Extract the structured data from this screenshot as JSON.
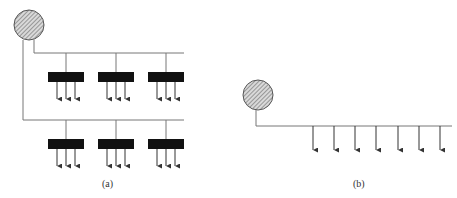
{
  "figure": {
    "panels": [
      {
        "id": "a",
        "caption": "(a)",
        "source": {
          "shape": "circle",
          "fill": "hatched",
          "cx": 29,
          "cy": 25,
          "r": 15
        },
        "branches": [
          {
            "y": 53,
            "units": [
              {
                "x": 50
              },
              {
                "x": 100
              },
              {
                "x": 150
              }
            ]
          },
          {
            "y": 120,
            "units": [
              {
                "x": 50
              },
              {
                "x": 100
              },
              {
                "x": 150
              }
            ]
          }
        ],
        "arrows_per_unit": 3
      },
      {
        "id": "b",
        "caption": "(b)",
        "source": {
          "shape": "circle",
          "fill": "hatched",
          "cx": 258,
          "cy": 95,
          "r": 15
        },
        "line_y": 126,
        "arrow_count": 7
      }
    ],
    "colors": {
      "line": "#777777",
      "unit": "#111111",
      "circle_fill": "#cccccc",
      "arrow": "#333333"
    }
  }
}
